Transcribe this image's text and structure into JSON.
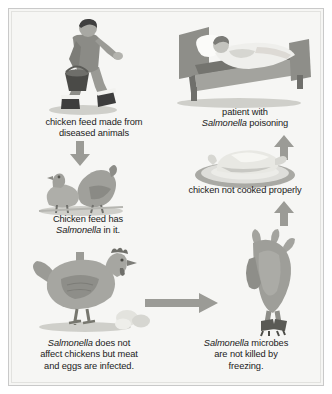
{
  "diagram": {
    "type": "flow-diagram",
    "background_color": "#f6f6f4",
    "border_color": "#c9c9c9",
    "arrow_color": "#9b9b96",
    "nodes": [
      {
        "id": "feed-source",
        "icon": "farmer-carrying-feed-bucket-illustration",
        "caption_lines": [
          "chicken feed made from",
          "diseased animals"
        ],
        "caption_plain": "chicken feed made from diseased animals"
      },
      {
        "id": "contaminated-feed",
        "icon": "two-birds-feeding-illustration",
        "caption_lines": [
          "Chicken feed has",
          "Salmonella in it."
        ],
        "caption_italic_word": "Salmonella",
        "caption_plain": "Chicken feed has Salmonella in it."
      },
      {
        "id": "infected-chicken",
        "icon": "hen-with-eggs-illustration",
        "caption_lines": [
          "Salmonella does not",
          "affect chickens but meat",
          "and eggs are infected."
        ],
        "caption_italic_word": "Salmonella",
        "caption_plain": "Salmonella does not affect chickens but meat and eggs are infected."
      },
      {
        "id": "frozen-chicken",
        "icon": "hanging-plucked-chicken-illustration",
        "caption_lines": [
          "Salmonella microbes",
          "are not killed by",
          "freezing."
        ],
        "caption_italic_word": "Salmonella",
        "caption_plain": "Salmonella microbes are not killed by freezing."
      },
      {
        "id": "undercooked-chicken",
        "icon": "roast-chicken-on-plate-illustration",
        "caption_lines": [
          "chicken not cooked properly"
        ],
        "caption_plain": "chicken not cooked properly"
      },
      {
        "id": "sick-patient",
        "icon": "patient-in-hospital-bed-illustration",
        "caption_lines": [
          "patient with",
          "Salmonella poisoning"
        ],
        "caption_italic_word": "Salmonella",
        "caption_plain": "patient with Salmonella poisoning"
      }
    ],
    "edges": [
      {
        "id": "edge-feed-to-birds",
        "from": "feed-source",
        "to": "contaminated-feed",
        "direction": "down"
      },
      {
        "id": "edge-birds-to-hen",
        "from": "contaminated-feed",
        "to": "infected-chicken",
        "direction": "down"
      },
      {
        "id": "edge-hen-to-frozen",
        "from": "infected-chicken",
        "to": "frozen-chicken",
        "direction": "right"
      },
      {
        "id": "edge-frozen-to-cooked",
        "from": "frozen-chicken",
        "to": "undercooked-chicken",
        "direction": "up"
      },
      {
        "id": "edge-cooked-to-patient",
        "from": "undercooked-chicken",
        "to": "sick-patient",
        "direction": "up"
      }
    ]
  }
}
